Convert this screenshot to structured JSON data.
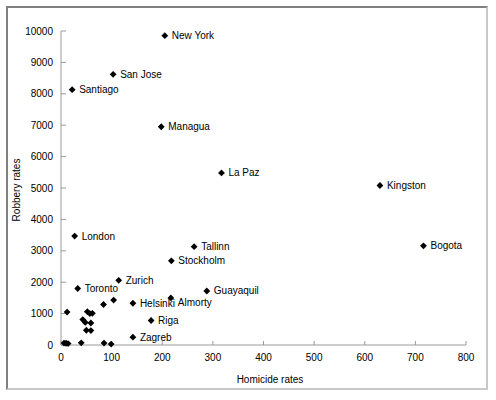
{
  "chart_data": {
    "type": "scatter",
    "title": "",
    "xlabel": "Homicide rates",
    "ylabel": "Robbery rates",
    "xlim": [
      0,
      800
    ],
    "ylim": [
      0,
      10000
    ],
    "xticks": [
      0,
      100,
      200,
      300,
      400,
      500,
      600,
      700,
      800
    ],
    "yticks": [
      0,
      1000,
      2000,
      3000,
      4000,
      5000,
      6000,
      7000,
      8000,
      9000,
      10000
    ],
    "grid": false,
    "legend": "none",
    "marker_color": "#000000",
    "marker_shape": "diamond",
    "points": [
      {
        "label": "New York",
        "x": 205,
        "y": 9850,
        "label_dx": 7,
        "label_dy": 3.5
      },
      {
        "label": "San Jose",
        "x": 103,
        "y": 8620,
        "label_dx": 7,
        "label_dy": 3.5
      },
      {
        "label": "Santiago",
        "x": 22,
        "y": 8130,
        "label_dx": 7,
        "label_dy": 3.5
      },
      {
        "label": "Managua",
        "x": 198,
        "y": 6950,
        "label_dx": 7,
        "label_dy": 3.5
      },
      {
        "label": "La Paz",
        "x": 317,
        "y": 5480,
        "label_dx": 7,
        "label_dy": 3.5
      },
      {
        "label": "Kingston",
        "x": 630,
        "y": 5080,
        "label_dx": 7,
        "label_dy": 3.5
      },
      {
        "label": "London",
        "x": 27,
        "y": 3470,
        "label_dx": 7,
        "label_dy": 3.5
      },
      {
        "label": "Bogota",
        "x": 716,
        "y": 3160,
        "label_dx": 7,
        "label_dy": 3.5
      },
      {
        "label": "Tallinn",
        "x": 263,
        "y": 3130,
        "label_dx": 7,
        "label_dy": 3.5
      },
      {
        "label": "Stockholm",
        "x": 218,
        "y": 2680,
        "label_dx": 7,
        "label_dy": 3.5
      },
      {
        "label": "Zurich",
        "x": 114,
        "y": 2060,
        "label_dx": 7,
        "label_dy": 3.5
      },
      {
        "label": "Toronto",
        "x": 33,
        "y": 1800,
        "label_dx": 7,
        "label_dy": 3.5
      },
      {
        "label": "Guayaquil",
        "x": 288,
        "y": 1720,
        "label_dx": 7,
        "label_dy": 3.5
      },
      {
        "label": "Almorty",
        "x": 217,
        "y": 1500,
        "label_dx": 7,
        "label_dy": 8.5
      },
      {
        "label": "Helsinki",
        "x": 142,
        "y": 1330,
        "label_dx": 7,
        "label_dy": 3.5
      },
      {
        "label": "Riga",
        "x": 178,
        "y": 780,
        "label_dx": 7,
        "label_dy": 3.5
      },
      {
        "label": "Zagreb",
        "x": 142,
        "y": 250,
        "label_dx": 7,
        "label_dy": 3.5
      },
      {
        "label": "",
        "x": 104,
        "y": 1430
      },
      {
        "label": "",
        "x": 84,
        "y": 1290
      },
      {
        "label": "",
        "x": 12,
        "y": 1050
      },
      {
        "label": "",
        "x": 52,
        "y": 1060
      },
      {
        "label": "",
        "x": 62,
        "y": 1010
      },
      {
        "label": "",
        "x": 57,
        "y": 1000
      },
      {
        "label": "",
        "x": 43,
        "y": 810
      },
      {
        "label": "",
        "x": 48,
        "y": 720
      },
      {
        "label": "",
        "x": 59,
        "y": 700
      },
      {
        "label": "",
        "x": 50,
        "y": 470
      },
      {
        "label": "",
        "x": 59,
        "y": 460
      },
      {
        "label": "",
        "x": 6,
        "y": 60
      },
      {
        "label": "",
        "x": 10,
        "y": 55
      },
      {
        "label": "",
        "x": 14,
        "y": 45
      },
      {
        "label": "",
        "x": 40,
        "y": 70
      },
      {
        "label": "",
        "x": 85,
        "y": 60
      },
      {
        "label": "",
        "x": 99,
        "y": 30
      }
    ]
  }
}
